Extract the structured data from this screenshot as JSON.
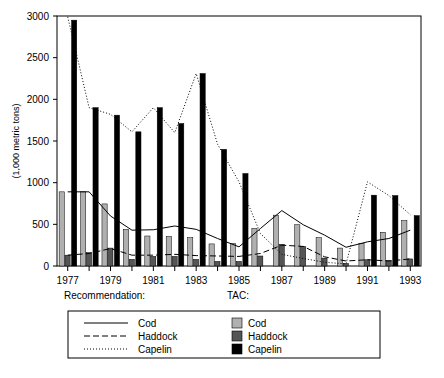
{
  "chart_data": {
    "type": "bar",
    "title": "",
    "subtitle": "",
    "xlabel": "",
    "ylabel": "(1,000 metric tons)",
    "ylim": [
      0,
      3000
    ],
    "yticks": [
      0,
      500,
      1000,
      1500,
      2000,
      2500,
      3000
    ],
    "ytick_labels": [
      "0",
      "500",
      "1000",
      "1500",
      "2000",
      "2500",
      "3000"
    ],
    "grid": false,
    "legend_position": "below-axes",
    "x": [
      1977,
      1978,
      1979,
      1980,
      1981,
      1982,
      1983,
      1984,
      1985,
      1986,
      1987,
      1988,
      1989,
      1990,
      1991,
      1992,
      1993
    ],
    "xtick_labels": [
      "1977",
      "",
      "1979",
      "",
      "1981",
      "",
      "1983",
      "",
      "1985",
      "",
      "1987",
      "",
      "1989",
      "",
      "1991",
      "",
      "1993"
    ],
    "xtick_labels_shown": [
      "1977",
      "1979",
      "1981",
      "1983",
      "1985",
      "1987",
      "1989",
      "1991",
      "1993"
    ],
    "series": [
      {
        "name": "Cod",
        "group": "TAC",
        "render": "bar",
        "color": "#b0b0b0",
        "values": [
          890,
          890,
          745,
          440,
          360,
          355,
          340,
          265,
          270,
          450,
          610,
          495,
          340,
          215,
          270,
          405,
          545
        ]
      },
      {
        "name": "Haddock",
        "group": "TAC",
        "render": "bar",
        "color": "#555555",
        "values": [
          130,
          160,
          215,
          80,
          115,
          115,
          80,
          55,
          55,
          120,
          260,
          235,
          95,
          30,
          75,
          65,
          85
        ]
      },
      {
        "name": "Capelin",
        "group": "TAC",
        "render": "bar",
        "color": "#000000",
        "values": [
          2950,
          1900,
          1810,
          1610,
          1900,
          1710,
          2310,
          1400,
          1110,
          0,
          0,
          0,
          0,
          0,
          850,
          845,
          605
        ]
      },
      {
        "name": "Cod",
        "group": "Recommendation",
        "render": "line",
        "style": "solid",
        "color": "#000000",
        "values": [
          890,
          890,
          600,
          430,
          435,
          480,
          440,
          330,
          230,
          450,
          665,
          495,
          370,
          225,
          290,
          330,
          430
        ]
      },
      {
        "name": "Haddock",
        "group": "Recommendation",
        "render": "line",
        "style": "dashed",
        "color": "#000000",
        "values": [
          130,
          150,
          210,
          130,
          130,
          140,
          125,
          120,
          115,
          150,
          250,
          235,
          110,
          60,
          75,
          60,
          85
        ]
      },
      {
        "name": "Capelin",
        "group": "Recommendation",
        "render": "line",
        "style": "dotted",
        "color": "#000000",
        "values": [
          2990,
          1900,
          1820,
          1610,
          1900,
          1600,
          2310,
          1460,
          1010,
          390,
          140,
          90,
          45,
          25,
          1010,
          845,
          615
        ]
      }
    ]
  },
  "axis": {
    "y_title": "(1,000 metric tons)"
  },
  "groups": {
    "recommendation_label": "Recommendation:",
    "tac_label": "TAC:"
  },
  "legend": {
    "recommendation": {
      "header": "Recommendation:",
      "items": [
        {
          "label": "Cod",
          "style": "solid"
        },
        {
          "label": "Haddock",
          "style": "dashed"
        },
        {
          "label": "Capelin",
          "style": "dotted"
        }
      ]
    },
    "tac": {
      "header": "TAC:",
      "items": [
        {
          "label": "Cod",
          "swatch": "#b0b0b0"
        },
        {
          "label": "Haddock",
          "swatch": "#555555"
        },
        {
          "label": "Capelin",
          "swatch": "#000000"
        }
      ]
    }
  },
  "colors": {
    "cod_bar": "#b0b0b0",
    "haddock_bar": "#555555",
    "capelin_bar": "#000000",
    "axis": "#000000",
    "background": "#ffffff"
  }
}
